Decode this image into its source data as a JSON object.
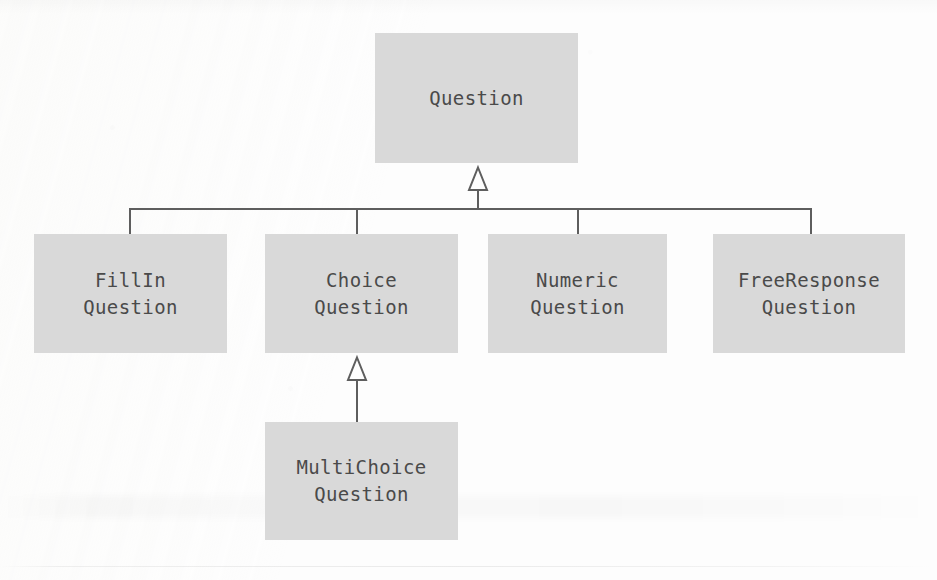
{
  "diagram": {
    "type": "uml-class-inheritance",
    "colors": {
      "box_fill": "#d9d9d9",
      "text": "#4a4a4a",
      "line": "#5e5e5e",
      "background": "#fdfdfd"
    },
    "classes": [
      {
        "id": "question",
        "name": "Question",
        "lines": [
          "Question"
        ],
        "role": "superclass",
        "x": 375,
        "y": 33,
        "w": 203,
        "h": 130
      },
      {
        "id": "fillin-question",
        "name": "FillIn Question",
        "lines": [
          "FillIn",
          "Question"
        ],
        "role": "subclass",
        "x": 34,
        "y": 234,
        "w": 193,
        "h": 119
      },
      {
        "id": "choice-question",
        "name": "Choice Question",
        "lines": [
          "Choice",
          "Question"
        ],
        "role": "subclass",
        "x": 265,
        "y": 234,
        "w": 193,
        "h": 119
      },
      {
        "id": "numeric-question",
        "name": "Numeric Question",
        "lines": [
          "Numeric",
          "Question"
        ],
        "role": "subclass",
        "x": 488,
        "y": 234,
        "w": 179,
        "h": 119
      },
      {
        "id": "freeresponse-question",
        "name": "FreeResponse Question",
        "lines": [
          "FreeResponse",
          "Question"
        ],
        "role": "subclass",
        "x": 713,
        "y": 234,
        "w": 192,
        "h": 119
      },
      {
        "id": "multichoice-question",
        "name": "MultiChoice Question",
        "lines": [
          "MultiChoice",
          "Question"
        ],
        "role": "subclass",
        "x": 265,
        "y": 422,
        "w": 193,
        "h": 118
      }
    ],
    "generalizations": [
      {
        "from": "fillin-question",
        "to": "question"
      },
      {
        "from": "choice-question",
        "to": "question"
      },
      {
        "from": "numeric-question",
        "to": "question"
      },
      {
        "from": "freeresponse-question",
        "to": "question"
      },
      {
        "from": "multichoice-question",
        "to": "choice-question"
      }
    ],
    "arrowheads": [
      {
        "id": "arrow-to-question",
        "target": "question",
        "style": "hollow-triangle",
        "direction": "up"
      },
      {
        "id": "arrow-to-choice",
        "target": "choice-question",
        "style": "hollow-triangle",
        "direction": "up"
      }
    ]
  }
}
